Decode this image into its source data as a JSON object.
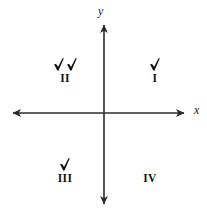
{
  "figure": {
    "type": "coordinate-plane",
    "background_color": "#ffffff",
    "line_color": "#2b2b2b",
    "text_color": "#111111"
  },
  "axes": {
    "x_label": "x",
    "y_label": "y",
    "x_arrow_left": "arrow-left",
    "x_arrow_right": "arrow-right",
    "y_arrow_up": "arrow-up",
    "y_arrow_down": "arrow-down",
    "origin": {
      "x": 104,
      "y": 113
    }
  },
  "quadrants": [
    {
      "id": "I",
      "label": "I",
      "checkmarks": 1,
      "position": "top-right"
    },
    {
      "id": "II",
      "label": "II",
      "checkmarks": 2,
      "position": "top-left"
    },
    {
      "id": "III",
      "label": "III",
      "checkmarks": 1,
      "position": "bottom-left"
    },
    {
      "id": "IV",
      "label": "IV",
      "checkmarks": 0,
      "position": "bottom-right"
    }
  ],
  "icons": {
    "checkmark": "check-icon"
  }
}
